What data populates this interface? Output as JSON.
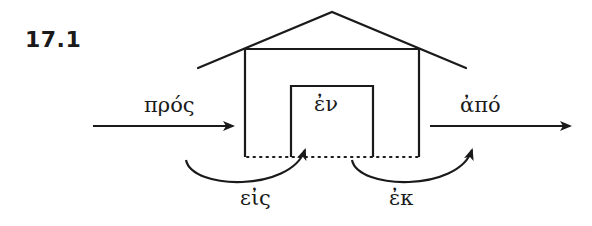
{
  "figure": {
    "label": "17.1",
    "stroke_color": "#1a1a1a",
    "background_color": "#ffffff"
  },
  "labels": {
    "pros": "πρός",
    "en": "ἐν",
    "apo": "ἀπό",
    "eis": "εἰς",
    "ek": "ἐκ"
  },
  "diagram": {
    "elements": [
      {
        "id": "pros",
        "meaning": "toward",
        "shape": "straight arrow approaching house from left"
      },
      {
        "id": "en",
        "meaning": "in",
        "shape": "text inside inner room"
      },
      {
        "id": "apo",
        "meaning": "away from",
        "shape": "straight arrow leaving house to the right"
      },
      {
        "id": "eis",
        "meaning": "into",
        "shape": "curved arrow from outside into inner room"
      },
      {
        "id": "ek",
        "meaning": "out of",
        "shape": "curved arrow from inner room to outside"
      }
    ]
  }
}
